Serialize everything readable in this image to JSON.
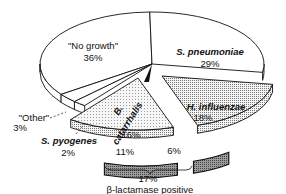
{
  "chart_data": {
    "type": "pie",
    "style": "3d-exploded",
    "title": "",
    "slices": [
      {
        "name": "\"No growth\"",
        "value": 36,
        "label": "\"No growth\"",
        "pct_label": "36%",
        "fill": "white",
        "italic": false
      },
      {
        "name": "S. pneumoniae",
        "value": 29,
        "label": "S. pneumoniae",
        "pct_label": "29%",
        "fill": "white",
        "italic": true
      },
      {
        "name": "H. influenzae",
        "value": 18,
        "label": "H. influenzae",
        "pct_label": "18%",
        "fill": "dotted",
        "italic": true,
        "sub": {
          "name": "H. influenzae β-lactamase positive",
          "value": 6,
          "pct_label": "6%"
        }
      },
      {
        "name": "B. catarrhalis",
        "value": 16,
        "label_line1": "B.",
        "label_line2": "catarrhalis",
        "pct_label": "16%",
        "fill": "light-dotted",
        "italic": true,
        "sub": {
          "name": "B. catarrhalis β-lactamase positive",
          "value": 11,
          "pct_label": "11%"
        }
      },
      {
        "name": "S. pyogenes",
        "value": 2,
        "label": "S. pyogenes",
        "pct_label": "2%",
        "fill": "white",
        "italic": true
      },
      {
        "name": "\"Other\"",
        "value": 3,
        "label": "\"Other\"",
        "pct_label": "3%",
        "fill": "white",
        "italic": false
      }
    ],
    "annotation": {
      "bracket_pct": "17%",
      "bracket_text": "β-lactamase positive",
      "value": 17
    },
    "legend": "none"
  }
}
